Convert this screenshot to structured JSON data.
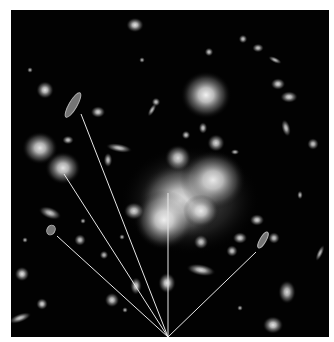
{
  "image": {
    "description": "Deep-field image of a galaxy cluster with gravitationally lensed arcs; straight lines converge from lensed images to a point at the bottom edge",
    "width": 334,
    "height": 342,
    "border_color": "#ffffff",
    "sky_color": "#020202",
    "sky_rect": {
      "x": 11,
      "y": 10,
      "w": 318,
      "h": 327
    }
  },
  "convergence_point": {
    "x": 168,
    "y": 337
  },
  "lines": [
    {
      "name": "line-to-upper-left-arc",
      "x1": 81,
      "y1": 114
    },
    {
      "name": "line-to-left-galaxy",
      "x1": 64,
      "y1": 174
    },
    {
      "name": "line-to-lower-left-arc",
      "x1": 57,
      "y1": 236
    },
    {
      "name": "line-to-cluster-core",
      "x1": 168,
      "y1": 193
    },
    {
      "name": "line-to-right-arc",
      "x1": 256,
      "y1": 252
    }
  ],
  "line_color": "#e8e8e8",
  "galaxies": [
    {
      "x": 206,
      "y": 95,
      "rx": 17,
      "ry": 16,
      "o": 0.95
    },
    {
      "x": 40,
      "y": 148,
      "rx": 12,
      "ry": 11,
      "o": 0.9
    },
    {
      "x": 63,
      "y": 168,
      "rx": 12,
      "ry": 11,
      "o": 0.9
    },
    {
      "x": 180,
      "y": 201,
      "rx": 28,
      "ry": 26,
      "o": 0.85
    },
    {
      "x": 213,
      "y": 180,
      "rx": 22,
      "ry": 20,
      "o": 0.9
    },
    {
      "x": 164,
      "y": 220,
      "rx": 20,
      "ry": 20,
      "o": 0.9
    },
    {
      "x": 201,
      "y": 211,
      "rx": 12,
      "ry": 11,
      "o": 0.85
    },
    {
      "x": 178,
      "y": 158,
      "rx": 9,
      "ry": 9,
      "o": 0.85
    },
    {
      "x": 216,
      "y": 143,
      "rx": 6,
      "ry": 6,
      "o": 0.85
    },
    {
      "x": 135,
      "y": 25,
      "rx": 6,
      "ry": 5,
      "o": 0.9
    },
    {
      "x": 45,
      "y": 90,
      "rx": 6,
      "ry": 6,
      "o": 0.9
    },
    {
      "x": 98,
      "y": 112,
      "rx": 5,
      "ry": 4,
      "o": 0.85
    },
    {
      "x": 119,
      "y": 148,
      "rx": 9,
      "ry": 3,
      "o": 0.8,
      "r": 10
    },
    {
      "x": 108,
      "y": 160,
      "rx": 3,
      "ry": 5,
      "o": 0.8
    },
    {
      "x": 134,
      "y": 211,
      "rx": 7,
      "ry": 6,
      "o": 0.85
    },
    {
      "x": 257,
      "y": 220,
      "rx": 5,
      "ry": 4,
      "o": 0.85
    },
    {
      "x": 274,
      "y": 238,
      "rx": 4,
      "ry": 4,
      "o": 0.8
    },
    {
      "x": 240,
      "y": 238,
      "rx": 5,
      "ry": 4,
      "o": 0.85
    },
    {
      "x": 232,
      "y": 251,
      "rx": 4,
      "ry": 4,
      "o": 0.8
    },
    {
      "x": 201,
      "y": 270,
      "rx": 10,
      "ry": 4,
      "o": 0.85,
      "r": 10
    },
    {
      "x": 287,
      "y": 292,
      "rx": 6,
      "ry": 8,
      "o": 0.85
    },
    {
      "x": 273,
      "y": 325,
      "rx": 7,
      "ry": 6,
      "o": 0.9
    },
    {
      "x": 201,
      "y": 242,
      "rx": 5,
      "ry": 5,
      "o": 0.8
    },
    {
      "x": 136,
      "y": 286,
      "rx": 4,
      "ry": 6,
      "o": 0.85
    },
    {
      "x": 112,
      "y": 300,
      "rx": 5,
      "ry": 5,
      "o": 0.85
    },
    {
      "x": 22,
      "y": 274,
      "rx": 5,
      "ry": 5,
      "o": 0.9
    },
    {
      "x": 42,
      "y": 304,
      "rx": 4,
      "ry": 4,
      "o": 0.85
    },
    {
      "x": 20,
      "y": 318,
      "rx": 8,
      "ry": 3,
      "o": 0.8,
      "r": -20
    },
    {
      "x": 80,
      "y": 240,
      "rx": 4,
      "ry": 4,
      "o": 0.8
    },
    {
      "x": 50,
      "y": 213,
      "rx": 8,
      "ry": 4,
      "o": 0.8,
      "r": 20
    },
    {
      "x": 167,
      "y": 283,
      "rx": 6,
      "ry": 7,
      "o": 0.9
    },
    {
      "x": 289,
      "y": 97,
      "rx": 6,
      "ry": 4,
      "o": 0.85
    },
    {
      "x": 278,
      "y": 84,
      "rx": 5,
      "ry": 4,
      "o": 0.85
    },
    {
      "x": 286,
      "y": 128,
      "rx": 3,
      "ry": 6,
      "o": 0.8,
      "r": -15
    },
    {
      "x": 313,
      "y": 144,
      "rx": 4,
      "ry": 4,
      "o": 0.8
    },
    {
      "x": 258,
      "y": 48,
      "rx": 4,
      "ry": 3,
      "o": 0.8
    },
    {
      "x": 243,
      "y": 39,
      "rx": 3,
      "ry": 3,
      "o": 0.8
    },
    {
      "x": 275,
      "y": 60,
      "rx": 5,
      "ry": 2,
      "o": 0.75,
      "r": 25
    },
    {
      "x": 156,
      "y": 102,
      "rx": 3,
      "ry": 3,
      "o": 0.8
    },
    {
      "x": 209,
      "y": 52,
      "rx": 3,
      "ry": 3,
      "o": 0.8
    },
    {
      "x": 186,
      "y": 135,
      "rx": 3,
      "ry": 3,
      "o": 0.8
    },
    {
      "x": 203,
      "y": 128,
      "rx": 3,
      "ry": 4,
      "o": 0.8
    },
    {
      "x": 235,
      "y": 152,
      "rx": 3,
      "ry": 2,
      "o": 0.75
    },
    {
      "x": 68,
      "y": 140,
      "rx": 4,
      "ry": 3,
      "o": 0.8
    },
    {
      "x": 152,
      "y": 110,
      "rx": 2,
      "ry": 5,
      "o": 0.75,
      "r": 30
    },
    {
      "x": 104,
      "y": 255,
      "rx": 3,
      "ry": 3,
      "o": 0.75
    },
    {
      "x": 83,
      "y": 221,
      "rx": 2,
      "ry": 2,
      "o": 0.7
    },
    {
      "x": 122,
      "y": 237,
      "rx": 2,
      "ry": 2,
      "o": 0.7
    },
    {
      "x": 300,
      "y": 195,
      "rx": 2,
      "ry": 3,
      "o": 0.75
    },
    {
      "x": 320,
      "y": 253,
      "rx": 2,
      "ry": 6,
      "o": 0.75,
      "r": 25
    },
    {
      "x": 240,
      "y": 308,
      "rx": 2,
      "ry": 2,
      "o": 0.7
    },
    {
      "x": 30,
      "y": 70,
      "rx": 2,
      "ry": 2,
      "o": 0.7
    },
    {
      "x": 25,
      "y": 240,
      "rx": 2,
      "ry": 2,
      "o": 0.7
    },
    {
      "x": 142,
      "y": 60,
      "rx": 2,
      "ry": 2,
      "o": 0.7
    },
    {
      "x": 125,
      "y": 310,
      "rx": 2,
      "ry": 2,
      "o": 0.7
    }
  ],
  "arcs": [
    {
      "name": "upper-left-lensed-arc",
      "x": 73,
      "y": 105,
      "rx": 14,
      "ry": 4,
      "r": -60
    },
    {
      "name": "lower-left-lensed-arc",
      "x": 51,
      "y": 230,
      "rx": 5,
      "ry": 4,
      "r": -60
    },
    {
      "name": "right-lensed-arc",
      "x": 263,
      "y": 240,
      "rx": 9,
      "ry": 3,
      "r": -60
    }
  ]
}
